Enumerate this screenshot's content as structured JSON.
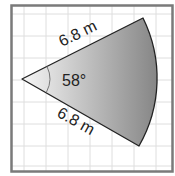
{
  "diagram": {
    "type": "circle-sector",
    "radius_label": "6.8 m",
    "radius_label_top": "6.8 m",
    "radius_label_bottom": "6.8 m",
    "angle_label": "58°",
    "angle_degrees": 58,
    "radius_value": 6.8,
    "radius_unit": "m",
    "colors": {
      "frame": "#777777",
      "grid": "#dcdcdc",
      "sector_light": "#f4f4f4",
      "sector_dark": "#8a8a8a",
      "outline": "#222222",
      "angle_arc": "#777777"
    }
  }
}
